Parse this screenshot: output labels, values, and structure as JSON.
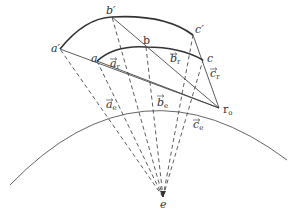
{
  "diagram": {
    "colors": {
      "stroke": "#333333",
      "earth_arc": "#555555",
      "background": "#ffffff"
    },
    "points": {
      "a_prime": {
        "label": "a′",
        "x": 60,
        "y": 49
      },
      "b_prime": {
        "label": "b′",
        "x": 112,
        "y": 17
      },
      "c_prime": {
        "label": "c′",
        "x": 193,
        "y": 35
      },
      "a": {
        "label": "a",
        "x": 97,
        "y": 61
      },
      "b": {
        "label": "b",
        "x": 146,
        "y": 47
      },
      "c": {
        "label": "c",
        "x": 203,
        "y": 60
      },
      "r0": {
        "label": "r",
        "sub": "o",
        "x": 219,
        "y": 108
      },
      "e": {
        "label": "e",
        "x": 163,
        "y": 197
      }
    },
    "vector_labels": {
      "a_r": {
        "base": "a",
        "sub": "r",
        "x": 110,
        "y": 67
      },
      "b_r": {
        "base": "b",
        "sub": "r",
        "x": 170,
        "y": 62
      },
      "c_r": {
        "base": "c",
        "sub": "r",
        "x": 210,
        "y": 77
      },
      "a_e": {
        "base": "a",
        "sub": "e",
        "x": 106,
        "y": 108
      },
      "b_e": {
        "base": "b",
        "sub": "e",
        "x": 157,
        "y": 106
      },
      "c_e": {
        "base": "c",
        "sub": "e",
        "x": 193,
        "y": 128
      }
    },
    "caption": "Fig. Geometry of view vectors"
  }
}
